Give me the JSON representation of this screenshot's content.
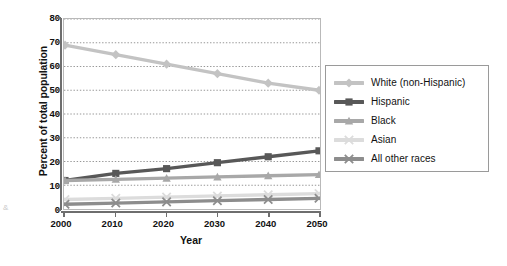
{
  "chart_data": {
    "type": "line",
    "title": "",
    "subtitle": "",
    "xlabel": "Year",
    "ylabel": "Percent of total population",
    "x": [
      2000,
      2010,
      2020,
      2030,
      2040,
      2050
    ],
    "categories": [
      "2000",
      "2010",
      "2020",
      "2030",
      "2040",
      "2050"
    ],
    "xlim": [
      2000,
      2050
    ],
    "ylim": [
      0,
      80
    ],
    "yticks": [
      0,
      10,
      20,
      30,
      40,
      50,
      60,
      70,
      80
    ],
    "ytick_labels": [
      "0",
      "10",
      "20",
      "30",
      "40",
      "50",
      "60",
      "70",
      "80"
    ],
    "xtick_labels": [
      "2000",
      "2010",
      "2020",
      "2030",
      "2040",
      "2050"
    ],
    "grid": "horizontal-dotted",
    "legend_position": "right",
    "series": [
      {
        "name": "White (non-Hispanic)",
        "values": [
          69,
          65,
          61,
          57,
          53,
          50
        ],
        "color": "#c3c3c3",
        "marker": "diamond"
      },
      {
        "name": "Hispanic",
        "values": [
          12,
          15,
          17,
          19.5,
          22,
          24.5
        ],
        "color": "#585858",
        "marker": "square"
      },
      {
        "name": "Black",
        "values": [
          12,
          12.5,
          13,
          13.5,
          14,
          14.5
        ],
        "color": "#a8a8a8",
        "marker": "triangle"
      },
      {
        "name": "Asian",
        "values": [
          4,
          4.5,
          5,
          5.5,
          6,
          6.5
        ],
        "color": "#dcdcdc",
        "marker": "cross"
      },
      {
        "name": "All other races",
        "values": [
          2,
          2.5,
          3,
          3.5,
          4,
          4.5
        ],
        "color": "#8d8d8d",
        "marker": "cross"
      }
    ]
  },
  "legend": {
    "items": [
      {
        "label": "White (non-Hispanic)"
      },
      {
        "label": "Hispanic"
      },
      {
        "label": "Black"
      },
      {
        "label": "Asian"
      },
      {
        "label": "All other races"
      }
    ]
  },
  "axes": {
    "y_title": "Percent of total population",
    "x_title": "Year"
  },
  "artifact": {
    "mark": "&"
  },
  "colors": {
    "white_non_hispanic": "#c3c3c3",
    "hispanic": "#585858",
    "black": "#a8a8a8",
    "asian": "#dcdcdc",
    "all_other_races": "#8d8d8d",
    "axis": "#6e6e6e",
    "gridline": "#8a8a8a",
    "plot_border": "#b9b9b9",
    "legend_border": "#9a9a9a",
    "text": "#111111"
  }
}
